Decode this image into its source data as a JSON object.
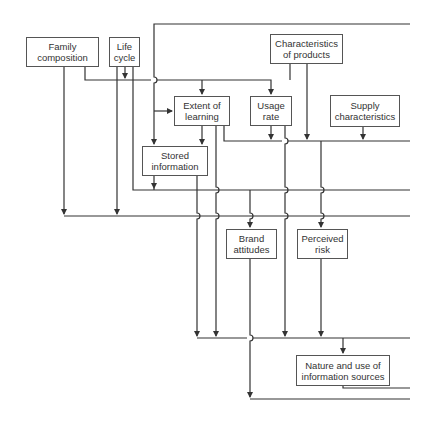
{
  "diagram": {
    "boxes": {
      "family_composition": "Family\ncomposition",
      "life_cycle": "Life\ncycle",
      "characteristics_of_products": "Characteristics\nof products",
      "extent_of_learning": "Extent of\nlearning",
      "usage_rate": "Usage\nrate",
      "supply_characteristics": "Supply\ncharacteristics",
      "stored_information": "Stored\ninformation",
      "brand_attitudes": "Brand\nattitudes",
      "perceived_risk": "Perceived\nrisk",
      "nature_and_use_of_information_sources": "Nature and use of\ninformation sources"
    },
    "colors": {
      "line": "#333333",
      "box_border": "#555555",
      "text": "#333333",
      "background": "#ffffff"
    }
  }
}
